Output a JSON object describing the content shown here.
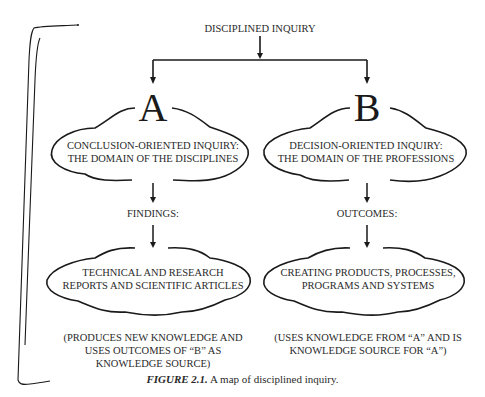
{
  "diagram": {
    "root": "DISCIPLINED INQUIRY",
    "branches": [
      {
        "letter": "A",
        "domain_lines": [
          "CONCLUSION-ORIENTED INQUIRY:",
          "THE DOMAIN OF THE DISCIPLINES"
        ],
        "label": "FINDINGS:",
        "result_lines": [
          "TECHNICAL AND RESEARCH",
          "REPORTS AND SCIENTIFIC ARTICLES"
        ],
        "note_lines": [
          "(PRODUCES NEW KNOWLEDGE AND",
          "USES OUTCOMES OF “B” AS",
          "KNOWLEDGE SOURCE)"
        ]
      },
      {
        "letter": "B",
        "domain_lines": [
          "DECISION-ORIENTED INQUIRY:",
          "THE DOMAIN OF THE PROFESSIONS"
        ],
        "label": "OUTCOMES:",
        "result_lines": [
          "CREATING PRODUCTS, PROCESSES,",
          "PROGRAMS AND SYSTEMS"
        ],
        "note_lines": [
          "(USES KNOWLEDGE FROM “A” AND IS",
          "KNOWLEDGE SOURCE FOR “A”)"
        ]
      }
    ]
  },
  "caption": {
    "figure_label": "FIGURE 2.1.",
    "text": " A map of disciplined inquiry."
  },
  "colors": {
    "ink": "#1a1a1a",
    "background": "#ffffff"
  }
}
